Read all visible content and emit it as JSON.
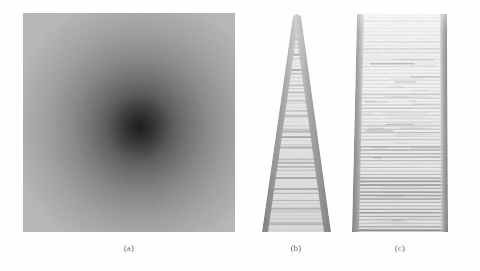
{
  "figure": {
    "background_color": "#ffffff",
    "panel_count": 3
  },
  "panels": [
    {
      "id": "a",
      "caption": "(a)",
      "kind": "grayscale-image",
      "description": "square noisy grayscale field, bright at edges, dark toward center",
      "bounds": {
        "x": 23,
        "y": 13,
        "width": 212,
        "height": 219
      },
      "caption_position": {
        "x": 129,
        "y": 248
      },
      "edge_gray": "#b4b4b4",
      "mid_gray": "#8f8f8f",
      "core_gray": "#2e2e2e",
      "core_center": {
        "x": 0.55,
        "y": 0.52
      },
      "grain": "film-noise"
    },
    {
      "id": "b",
      "caption": "(b)",
      "kind": "grayscale-image",
      "description": "narrow tapering wedge with dark side edges and horizontal striations",
      "bounds": {
        "x": 255,
        "y": 10,
        "width": 82,
        "height": 226
      },
      "caption_position": {
        "x": 296,
        "y": 248
      },
      "apex": {
        "x": 298,
        "y": 15
      },
      "base_left": {
        "x": 262,
        "y": 232
      },
      "base_right": {
        "x": 330,
        "y": 232
      },
      "edge_gray": "#8d8d8d",
      "interior_gray": "#e7e7e7",
      "stripe_gray": "#b6b6b6",
      "stripe_count": 58
    },
    {
      "id": "c",
      "caption": "(c)",
      "kind": "grayscale-image",
      "description": "trapezoidal slab, light and sparse at top, dense horizontal striations toward bottom, dark vertical side edges",
      "bounds": {
        "x": 346,
        "y": 10,
        "width": 110,
        "height": 226
      },
      "caption_position": {
        "x": 400,
        "y": 248
      },
      "top_left": {
        "x": 358,
        "y": 14
      },
      "top_right": {
        "x": 447,
        "y": 14
      },
      "bottom_left": {
        "x": 352,
        "y": 232
      },
      "bottom_right": {
        "x": 448,
        "y": 232
      },
      "edge_gray": "#8a8a8a",
      "interior_gray": "#f2f2f2",
      "stripe_gray": "#bcbcbc",
      "stripe_count": 62
    }
  ]
}
